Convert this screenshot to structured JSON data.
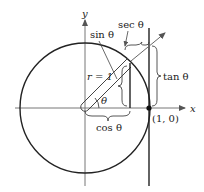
{
  "diagram": {
    "axes": {
      "x_label": "x",
      "y_label": "y"
    },
    "labels": {
      "sin": "sin θ",
      "sec": "sec θ",
      "tan": "tan θ",
      "cos": "cos θ",
      "radius": "r = 1",
      "angle": "θ",
      "point": "(1, 0)"
    },
    "colors": {
      "line": "#222222",
      "background": "#ffffff"
    }
  }
}
